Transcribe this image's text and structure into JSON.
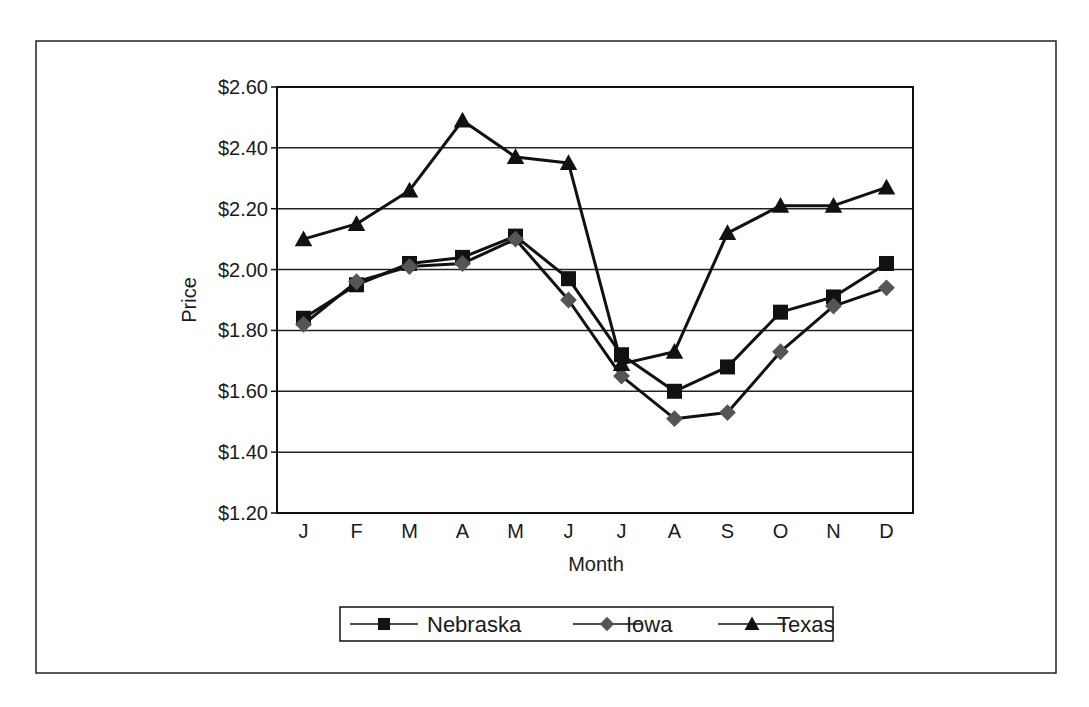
{
  "chart_data": {
    "type": "line",
    "title": "",
    "xlabel": "Month",
    "ylabel": "Price",
    "categories": [
      "J",
      "F",
      "M",
      "A",
      "M",
      "J",
      "J",
      "A",
      "S",
      "O",
      "N",
      "D"
    ],
    "ylim": [
      1.2,
      2.6
    ],
    "yticks": [
      1.2,
      1.4,
      1.6,
      1.8,
      2.0,
      2.2,
      2.4,
      2.6
    ],
    "ytick_labels": [
      "$1.20",
      "$1.40",
      "$1.60",
      "$1.80",
      "$2.00",
      "$2.20",
      "$2.40",
      "$2.60"
    ],
    "grid": true,
    "legend_position": "bottom-center",
    "series": [
      {
        "name": "Nebraska",
        "marker": "square",
        "color": "#111111",
        "values": [
          1.84,
          1.95,
          2.02,
          2.04,
          2.11,
          1.97,
          1.72,
          1.6,
          1.68,
          1.86,
          1.91,
          2.02
        ]
      },
      {
        "name": "Iowa",
        "marker": "diamond",
        "color": "#111111",
        "marker_color": "#555555",
        "values": [
          1.82,
          1.96,
          2.01,
          2.02,
          2.1,
          1.9,
          1.65,
          1.51,
          1.53,
          1.73,
          1.88,
          1.94
        ]
      },
      {
        "name": "Texas",
        "marker": "triangle",
        "color": "#111111",
        "values": [
          2.1,
          2.15,
          2.26,
          2.49,
          2.37,
          2.35,
          1.69,
          1.73,
          2.12,
          2.21,
          2.21,
          2.27
        ]
      }
    ]
  }
}
